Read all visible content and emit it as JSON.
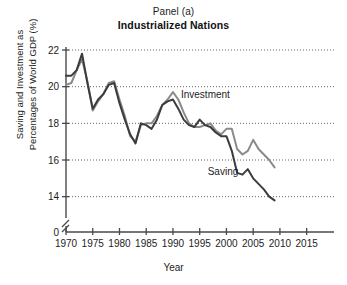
{
  "figure": {
    "panel_label": "Panel (a)",
    "title": "Industrialized Nations",
    "ylabel_line1": "Saving and Investment as",
    "ylabel_line2": "Percentages of World GDP (%)",
    "xlabel": "Year"
  },
  "colors": {
    "investment": "#8a8a8a",
    "saving": "#3c3c3c",
    "axis": "#4a4a4a",
    "grid": "#555555",
    "text": "#1d1d1d"
  },
  "chart_data": {
    "type": "line",
    "title": "Industrialized Nations",
    "subtitle": "Panel (a)",
    "xlabel": "Year",
    "ylabel": "Saving and Investment as Percentages of World GDP (%)",
    "xlim": [
      1970,
      2016
    ],
    "ylim": [
      13.0,
      22.0
    ],
    "y_axis_break": true,
    "y_axis_break_between": [
      0,
      13.0
    ],
    "grid": "horizontal-dotted",
    "legend": "inline-annotations",
    "xticks": [
      1970,
      1975,
      1980,
      1985,
      1990,
      1995,
      2000,
      2005,
      2010,
      2015
    ],
    "xticklabels": [
      "1970",
      "1975",
      "1980",
      "1985",
      "1990",
      "1995",
      "2000",
      "2005",
      "2010",
      "2015"
    ],
    "yticks": [
      0,
      14,
      16,
      18,
      20,
      22
    ],
    "yticklabels": [
      "0",
      "14",
      "16",
      "18",
      "20",
      "22"
    ],
    "annotations": [
      {
        "text": "Investment",
        "x": 1991.5,
        "y": 19.4
      },
      {
        "text": "Saving",
        "x": 1996.5,
        "y": 15.2
      }
    ],
    "x": [
      1970,
      1971,
      1972,
      1973,
      1974,
      1975,
      1976,
      1977,
      1978,
      1979,
      1980,
      1981,
      1982,
      1983,
      1984,
      1985,
      1986,
      1987,
      1988,
      1989,
      1990,
      1991,
      1992,
      1993,
      1994,
      1995,
      1996,
      1997,
      1998,
      1999,
      2000,
      2001,
      2002,
      2003,
      2004,
      2005,
      2006,
      2007,
      2008,
      2009
    ],
    "series": [
      {
        "name": "Investment",
        "color": "#8a8a8a",
        "values": [
          20.1,
          20.2,
          20.9,
          21.5,
          20.3,
          18.7,
          19.2,
          19.6,
          20.2,
          20.3,
          19.3,
          18.4,
          17.3,
          17.0,
          17.9,
          18.0,
          18.0,
          18.4,
          19.0,
          19.3,
          19.7,
          19.3,
          18.6,
          18.0,
          17.8,
          17.8,
          17.9,
          18.0,
          17.6,
          17.4,
          17.7,
          17.7,
          16.6,
          16.3,
          16.5,
          17.1,
          16.6,
          16.3,
          16.0,
          15.6
        ]
      },
      {
        "name": "Saving",
        "color": "#3c3c3c",
        "values": [
          20.6,
          20.6,
          20.9,
          21.8,
          20.2,
          18.8,
          19.3,
          19.6,
          20.1,
          20.2,
          19.1,
          18.2,
          17.4,
          16.9,
          18.0,
          17.9,
          17.7,
          18.2,
          19.0,
          19.2,
          19.3,
          18.8,
          18.2,
          17.9,
          17.8,
          18.2,
          17.9,
          17.8,
          17.5,
          17.3,
          17.3,
          16.5,
          15.3,
          15.2,
          15.5,
          15.0,
          14.7,
          14.4,
          14.0,
          13.8
        ]
      }
    ]
  }
}
